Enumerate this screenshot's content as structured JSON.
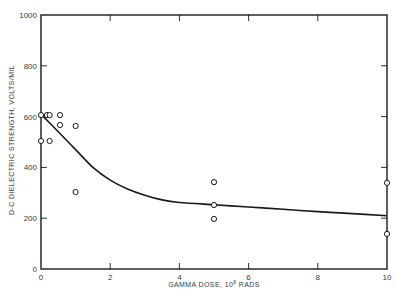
{
  "chart_data": {
    "type": "scatter",
    "title": "",
    "xlabel": "GAMMA DOSE, 10^8 RADS",
    "xlabel_parts": {
      "prefix": "GAMMA DOSE, 10",
      "exponent": "8",
      "suffix": " RADS"
    },
    "ylabel": "D-C DIELECTRIC STRENGTH, VOLTS/MIL",
    "xlim": [
      0,
      10
    ],
    "ylim": [
      0,
      1000
    ],
    "x_ticks": [
      0,
      2,
      4,
      6,
      8,
      10
    ],
    "x_tick_labels": [
      "0",
      "2",
      "4",
      "6",
      "8",
      "10"
    ],
    "y_ticks": [
      0,
      200,
      400,
      600,
      800,
      1000
    ],
    "y_tick_labels": [
      "0",
      "200",
      "400",
      "600",
      "800",
      "1000"
    ],
    "grid": false,
    "legend": null,
    "series": [
      {
        "name": "Measured",
        "kind": "scatter",
        "marker": "open-circle",
        "points": [
          {
            "x": 0.0,
            "y": 606
          },
          {
            "x": 0.17,
            "y": 606
          },
          {
            "x": 0.25,
            "y": 606
          },
          {
            "x": 0.55,
            "y": 606
          },
          {
            "x": 0.55,
            "y": 567
          },
          {
            "x": 1.0,
            "y": 563
          },
          {
            "x": 0.0,
            "y": 504
          },
          {
            "x": 0.25,
            "y": 504
          },
          {
            "x": 1.0,
            "y": 303
          },
          {
            "x": 5.0,
            "y": 342
          },
          {
            "x": 5.0,
            "y": 252
          },
          {
            "x": 5.0,
            "y": 197
          },
          {
            "x": 10.0,
            "y": 339
          },
          {
            "x": 10.0,
            "y": 138
          }
        ]
      },
      {
        "name": "Trend",
        "kind": "line",
        "points": [
          {
            "x": 0.0,
            "y": 610
          },
          {
            "x": 0.5,
            "y": 540
          },
          {
            "x": 1.0,
            "y": 470
          },
          {
            "x": 1.5,
            "y": 400
          },
          {
            "x": 2.0,
            "y": 350
          },
          {
            "x": 2.5,
            "y": 315
          },
          {
            "x": 3.0,
            "y": 290
          },
          {
            "x": 3.5,
            "y": 272
          },
          {
            "x": 4.0,
            "y": 262
          },
          {
            "x": 5.0,
            "y": 253
          },
          {
            "x": 6.0,
            "y": 244
          },
          {
            "x": 7.0,
            "y": 235
          },
          {
            "x": 8.0,
            "y": 226
          },
          {
            "x": 9.0,
            "y": 218
          },
          {
            "x": 10.0,
            "y": 210
          }
        ]
      }
    ]
  },
  "colors": {
    "ink": "#1a1a1a",
    "text": "#3a3a3a",
    "background": "#ffffff"
  }
}
